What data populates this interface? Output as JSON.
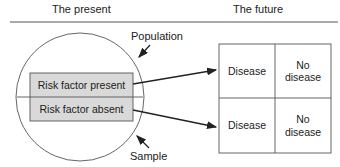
{
  "headers": {
    "present": "The present",
    "future": "The future"
  },
  "labels": {
    "population": "Population",
    "sample": "Sample"
  },
  "sample_groups": [
    {
      "label": "Risk factor present"
    },
    {
      "label": "Risk factor absent"
    }
  ],
  "outcome_grid": [
    {
      "disease": "Disease",
      "no_disease": "No\ndisease"
    },
    {
      "disease": "Disease",
      "no_disease": "No\ndisease"
    }
  ],
  "colors": {
    "line": "#333333",
    "sample_fill": "#d9d9d9",
    "text": "#222222"
  }
}
